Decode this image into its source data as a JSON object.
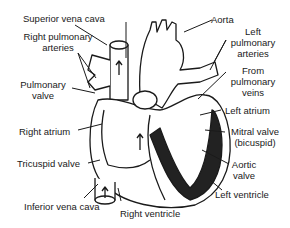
{
  "diagram": {
    "type": "anatomical-labeled-illustration",
    "labels": {
      "superior_vena_cava": "Superior vena cava",
      "right_pulmonary_arteries_1": "Right pulmonary",
      "right_pulmonary_arteries_2": "arteries",
      "pulmonary_valve_1": "Pulmonary",
      "pulmonary_valve_2": "valve",
      "right_atrium": "Right atrium",
      "tricuspid_valve": "Tricuspid valve",
      "inferior_vena_cava": "Inferior vena cava",
      "right_ventricle": "Right ventricle",
      "aorta": "Aorta",
      "left_pulmonary_arteries_1": "Left",
      "left_pulmonary_arteries_2": "pulmonary",
      "left_pulmonary_arteries_3": "arteries",
      "from_pulmonary_veins_1": "From",
      "from_pulmonary_veins_2": "pulmonary",
      "from_pulmonary_veins_3": "veins",
      "left_atrium": "Left atrium",
      "mitral_valve_1": "Mitral valve",
      "mitral_valve_2": "(bicuspid)",
      "aortic_valve_1": "Aortic",
      "aortic_valve_2": "valve",
      "left_ventricle": "Left ventricle"
    },
    "colors": {
      "ink": "#1a1a1a",
      "background": "#ffffff",
      "muscle": "#222222"
    }
  }
}
